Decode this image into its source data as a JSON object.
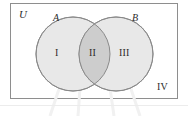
{
  "figure": {
    "type": "venn-diagram",
    "title_visible": false,
    "universe_label": "U",
    "set_labels": {
      "left": "A",
      "right": "B"
    },
    "region_labels": [
      {
        "id": "region-1",
        "text": "I",
        "meaning": "A only"
      },
      {
        "id": "region-2",
        "text": "II",
        "meaning": "A and B"
      },
      {
        "id": "region-3",
        "text": "III",
        "meaning": "B only"
      },
      {
        "id": "region-4",
        "text": "IV",
        "meaning": "outside A and B"
      }
    ],
    "colors": {
      "set_fill": "#e8e8e8",
      "intersection_fill": "#cdcdcd",
      "circle_stroke": "#8a8a8a",
      "box_stroke": "#8e8e8e",
      "text": "#2b2b2b",
      "spoke": "#f0f0f0",
      "background": "#ffffff"
    },
    "geometry": {
      "box": {
        "x": 10,
        "y": 3,
        "width": 168,
        "height": 96
      },
      "circle_left": {
        "cx": 73,
        "cy": 54,
        "r": 37
      },
      "circle_right": {
        "cx": 116,
        "cy": 54,
        "r": 37
      }
    }
  }
}
